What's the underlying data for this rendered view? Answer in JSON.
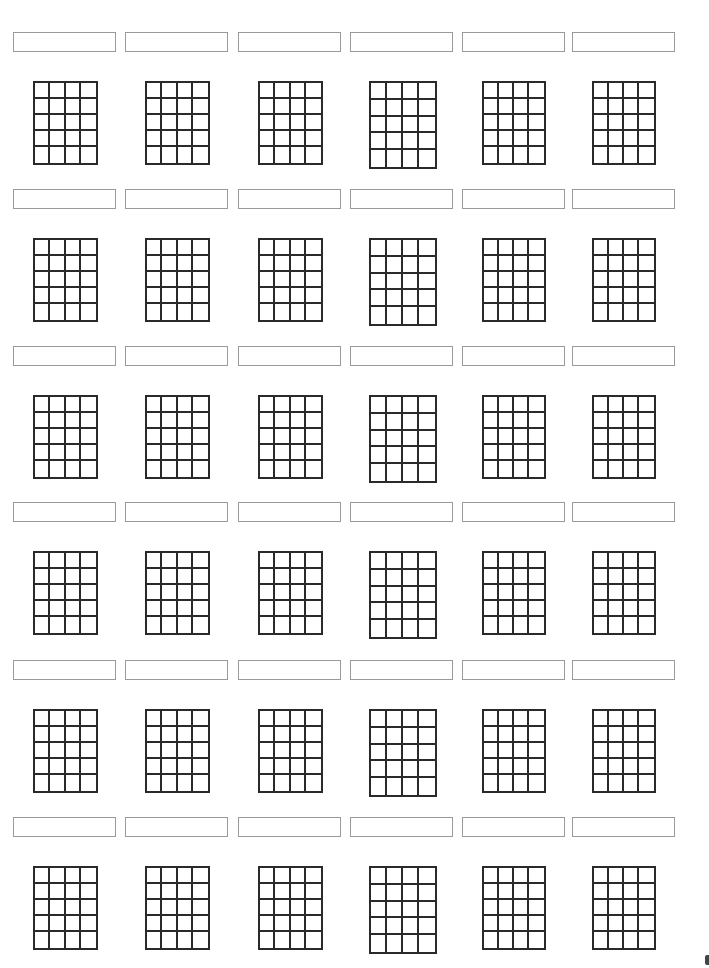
{
  "document": {
    "type": "blank chord diagram worksheet",
    "rows": 6,
    "columns": 6,
    "grid": {
      "frets": 5,
      "string_gaps": 4
    },
    "line_color": "#2a2a2a",
    "label_border_color": "#9a9a9a"
  },
  "layout": {
    "label_x": [
      13,
      125,
      238,
      350,
      462,
      572
    ],
    "grid_x": [
      33,
      145,
      258,
      369,
      482,
      592
    ],
    "grid_w": [
      65,
      65,
      65,
      68,
      64,
      64
    ],
    "grid_h": [
      84,
      84,
      84,
      88,
      84,
      84
    ],
    "label_y": [
      32,
      189,
      346,
      502,
      660,
      817
    ],
    "grid_y_offset": 49
  },
  "chords": [
    [
      {
        "name": ""
      },
      {
        "name": ""
      },
      {
        "name": ""
      },
      {
        "name": ""
      },
      {
        "name": ""
      },
      {
        "name": ""
      }
    ],
    [
      {
        "name": ""
      },
      {
        "name": ""
      },
      {
        "name": ""
      },
      {
        "name": ""
      },
      {
        "name": ""
      },
      {
        "name": ""
      }
    ],
    [
      {
        "name": ""
      },
      {
        "name": ""
      },
      {
        "name": ""
      },
      {
        "name": ""
      },
      {
        "name": ""
      },
      {
        "name": ""
      }
    ],
    [
      {
        "name": ""
      },
      {
        "name": ""
      },
      {
        "name": ""
      },
      {
        "name": ""
      },
      {
        "name": ""
      },
      {
        "name": ""
      }
    ],
    [
      {
        "name": ""
      },
      {
        "name": ""
      },
      {
        "name": ""
      },
      {
        "name": ""
      },
      {
        "name": ""
      },
      {
        "name": ""
      }
    ],
    [
      {
        "name": ""
      },
      {
        "name": ""
      },
      {
        "name": ""
      },
      {
        "name": ""
      },
      {
        "name": ""
      },
      {
        "name": ""
      }
    ]
  ]
}
